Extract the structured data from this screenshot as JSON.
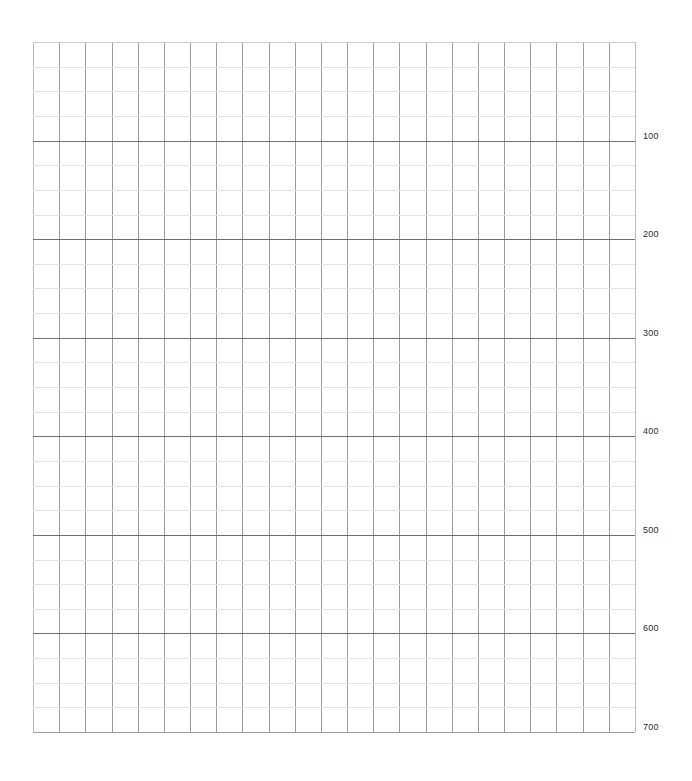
{
  "chart_data": {
    "type": "line",
    "title": "",
    "subtitle": "",
    "xlabel": "",
    "ylabel": "",
    "series": [],
    "x": [],
    "categories": [],
    "grid": true,
    "legend": false,
    "legend_position": "none",
    "y_axis": {
      "position": "right",
      "tick_labels": [
        "100",
        "200",
        "300",
        "400",
        "500",
        "600",
        "700"
      ],
      "tick_values": [
        100,
        200,
        300,
        400,
        500,
        600,
        700
      ],
      "ylim": [
        0,
        700
      ],
      "major_interval": 100,
      "minor_per_major": 4
    },
    "x_axis": {
      "tick_labels": [],
      "minor_divisions": 23
    },
    "annotations": [],
    "colors": {
      "background": "#ffffff",
      "minor_gridline": "#e2e2e2",
      "major_gridline": "#6f6f6f",
      "vertical_gridline": "#9a9a9a",
      "border": "#b9b9b9",
      "label_text": "#2b2b2b"
    },
    "geometry": {
      "plot_left": 33,
      "plot_top": 42,
      "plot_right": 635,
      "plot_bottom": 732,
      "columns": 23,
      "rows": 28
    }
  }
}
